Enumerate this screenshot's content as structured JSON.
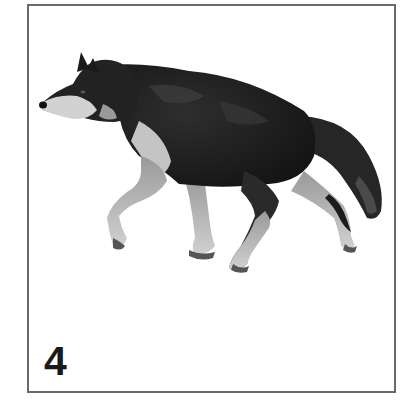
{
  "card": {
    "number": "4",
    "subject": "wolf walking, side profile facing left",
    "border_color": "#6a6a6a",
    "background_color": "#ffffff"
  },
  "colors": {
    "fur_dark": "#1c1c1c",
    "fur_mid": "#3a3a3a",
    "fur_light": "#c8c8c8",
    "muzzle": "#d6d6d6",
    "legs": "#bdbdbd",
    "paw_shadow": "#555555"
  }
}
